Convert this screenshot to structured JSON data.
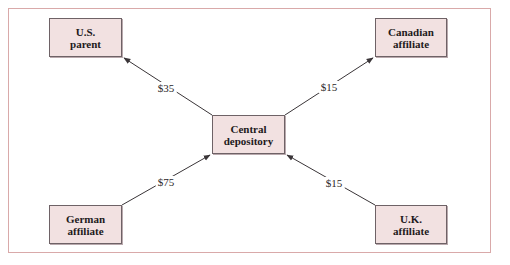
{
  "diagram": {
    "type": "netting-flow",
    "colors": {
      "frame_border": "#d9a9a9",
      "node_fill": "#f2e1e1",
      "node_border": "#6e6266",
      "arrow": "#3a3538",
      "text": "#1e1a1c"
    },
    "nodes": [
      {
        "id": "us_parent",
        "line1": "U.S.",
        "line2": "parent"
      },
      {
        "id": "canadian_affiliate",
        "line1": "Canadian",
        "line2": "affiliate"
      },
      {
        "id": "central_depository",
        "line1": "Central",
        "line2": "depository"
      },
      {
        "id": "german_affiliate",
        "line1": "German",
        "line2": "affiliate"
      },
      {
        "id": "uk_affiliate",
        "line1": "U.K.",
        "line2": "affiliate"
      }
    ],
    "flows": [
      {
        "from": "central_depository",
        "to": "us_parent",
        "label": "$35"
      },
      {
        "from": "central_depository",
        "to": "canadian_affiliate",
        "label": "$15"
      },
      {
        "from": "german_affiliate",
        "to": "central_depository",
        "label": "$75"
      },
      {
        "from": "uk_affiliate",
        "to": "central_depository",
        "label": "$15"
      }
    ]
  }
}
